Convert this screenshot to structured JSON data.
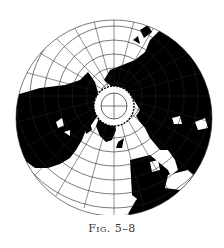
{
  "figure": {
    "caption": "Fig. 5–8",
    "type": "polar azimuthal projection map of the Northern Hemisphere",
    "colors": {
      "land": "#000000",
      "ocean": "#ffffff",
      "graticule": "#222222"
    }
  }
}
